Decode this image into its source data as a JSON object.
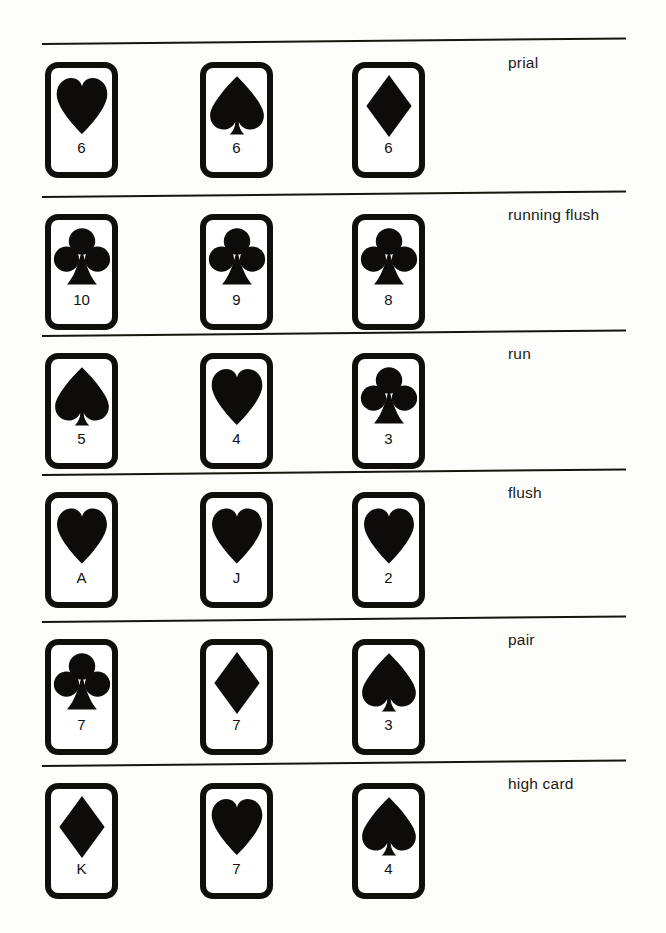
{
  "page": {
    "background_color": "#fdfdfb",
    "ink_color": "#17150f"
  },
  "layout": {
    "card_columns_x": [
      45,
      200,
      352
    ],
    "card_width": 73,
    "card_height": 116,
    "rule_left": 42,
    "rule_width": 584,
    "label_left": 508
  },
  "rows": [
    {
      "label": "prial",
      "rule_y": 43,
      "rule_tilt_deg": -0.55,
      "label_y": 54,
      "cards_y": 62,
      "cards": [
        {
          "rank": "6",
          "suit": "heart",
          "suit_icon": "heart-icon"
        },
        {
          "rank": "6",
          "suit": "spade",
          "suit_icon": "spade-icon"
        },
        {
          "rank": "6",
          "suit": "diamond",
          "suit_icon": "diamond-icon"
        }
      ]
    },
    {
      "label": "running flush",
      "rule_y": 196,
      "rule_tilt_deg": -0.55,
      "label_y": 206,
      "cards_y": 214,
      "cards": [
        {
          "rank": "10",
          "suit": "club",
          "suit_icon": "club-icon"
        },
        {
          "rank": "9",
          "suit": "club",
          "suit_icon": "club-icon"
        },
        {
          "rank": "8",
          "suit": "club",
          "suit_icon": "club-icon"
        }
      ]
    },
    {
      "label": "run",
      "rule_y": 335,
      "rule_tilt_deg": -0.55,
      "label_y": 345,
      "cards_y": 353,
      "cards": [
        {
          "rank": "5",
          "suit": "spade",
          "suit_icon": "spade-icon"
        },
        {
          "rank": "4",
          "suit": "heart",
          "suit_icon": "heart-icon"
        },
        {
          "rank": "3",
          "suit": "club",
          "suit_icon": "club-icon"
        }
      ]
    },
    {
      "label": "flush",
      "rule_y": 474,
      "rule_tilt_deg": -0.55,
      "label_y": 484,
      "cards_y": 492,
      "cards": [
        {
          "rank": "A",
          "suit": "heart",
          "suit_icon": "heart-icon"
        },
        {
          "rank": "J",
          "suit": "heart",
          "suit_icon": "heart-icon"
        },
        {
          "rank": "2",
          "suit": "heart",
          "suit_icon": "heart-icon"
        }
      ]
    },
    {
      "label": "pair",
      "rule_y": 621,
      "rule_tilt_deg": -0.55,
      "label_y": 631,
      "cards_y": 639,
      "cards": [
        {
          "rank": "7",
          "suit": "club",
          "suit_icon": "club-icon"
        },
        {
          "rank": "7",
          "suit": "diamond",
          "suit_icon": "diamond-icon"
        },
        {
          "rank": "3",
          "suit": "spade",
          "suit_icon": "spade-icon"
        }
      ]
    },
    {
      "label": "high card",
      "rule_y": 765,
      "rule_tilt_deg": -0.55,
      "label_y": 775,
      "cards_y": 783,
      "cards": [
        {
          "rank": "K",
          "suit": "diamond",
          "suit_icon": "diamond-icon"
        },
        {
          "rank": "7",
          "suit": "heart",
          "suit_icon": "heart-icon"
        },
        {
          "rank": "4",
          "suit": "spade",
          "suit_icon": "spade-icon"
        }
      ]
    }
  ]
}
